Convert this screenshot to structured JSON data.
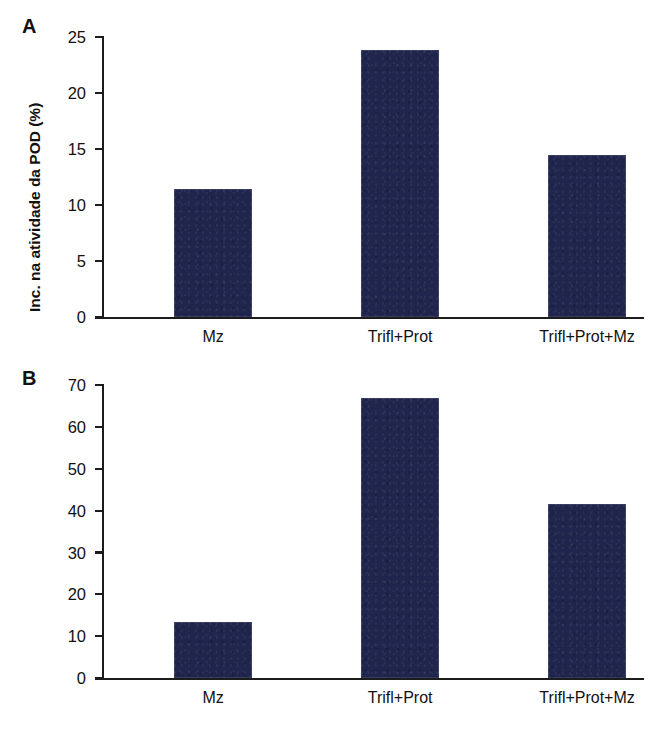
{
  "figure": {
    "background_color": "#ffffff",
    "bar_color": "#20254d",
    "axis_color": "#1c1c1c"
  },
  "panels": [
    {
      "letter": "A",
      "ylabel": "Inc. na atividade da POD (%)",
      "yticks": [
        "0",
        "5",
        "10",
        "15",
        "20",
        "25"
      ],
      "categories": [
        "Mz",
        "Trifl+Prot",
        "Trifl+Prot+Mz"
      ],
      "values": [
        11.4,
        23.8,
        14.5
      ]
    },
    {
      "letter": "B",
      "ylabel": "Inc. na atividade da POD (%)",
      "yticks": [
        "0",
        "10",
        "20",
        "30",
        "40",
        "50",
        "60",
        "70"
      ],
      "categories": [
        "Mz",
        "Trifl+Prot",
        "Trifl+Prot+Mz"
      ],
      "values": [
        13.5,
        67.0,
        41.5
      ]
    }
  ],
  "chart_data": [
    {
      "type": "bar",
      "panel": "A",
      "title": "",
      "xlabel": "",
      "ylabel": "Inc. na atividade da POD (%)",
      "categories": [
        "Mz",
        "Trifl+Prot",
        "Trifl+Prot+Mz"
      ],
      "values": [
        11.4,
        23.8,
        14.5
      ],
      "ylim": [
        0,
        25
      ],
      "ytick_values": [
        0,
        5,
        10,
        15,
        20,
        25
      ],
      "ytick_labels": [
        "0",
        "5",
        "10",
        "15",
        "20",
        "25"
      ],
      "grid": false,
      "legend": null,
      "bar_color": "#20254d"
    },
    {
      "type": "bar",
      "panel": "B",
      "title": "",
      "xlabel": "",
      "ylabel": "Inc. na atividade da POD (%)",
      "categories": [
        "Mz",
        "Trifl+Prot",
        "Trifl+Prot+Mz"
      ],
      "values": [
        13.5,
        67.0,
        41.5
      ],
      "ylim": [
        0,
        70
      ],
      "ytick_values": [
        0,
        10,
        20,
        30,
        40,
        50,
        60,
        70
      ],
      "ytick_labels": [
        "0",
        "10",
        "20",
        "30",
        "40",
        "50",
        "60",
        "70"
      ],
      "grid": false,
      "legend": null,
      "bar_color": "#20254d"
    }
  ]
}
